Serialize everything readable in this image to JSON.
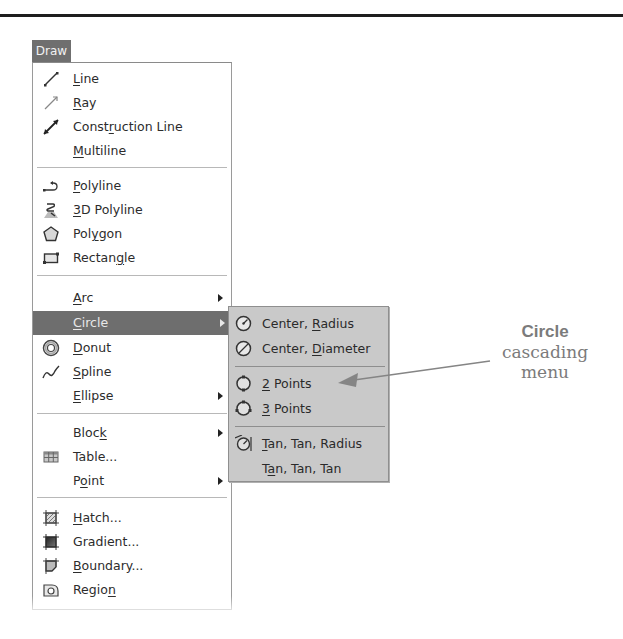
{
  "menu": {
    "title": "Draw",
    "groups": [
      {
        "items": [
          {
            "label_pre": "",
            "mnemonic": "L",
            "label_post": "ine",
            "icon": "line-icon",
            "submenu": false
          },
          {
            "label_pre": "",
            "mnemonic": "R",
            "label_post": "ay",
            "icon": "ray-icon",
            "submenu": false
          },
          {
            "label_pre": "Const",
            "mnemonic": "r",
            "label_post": "uction Line",
            "icon": "construction-line-icon",
            "submenu": false
          },
          {
            "label_pre": "",
            "mnemonic": "M",
            "label_post": "ultiline",
            "icon": "",
            "submenu": false
          }
        ]
      },
      {
        "items": [
          {
            "label_pre": "",
            "mnemonic": "P",
            "label_post": "olyline",
            "icon": "polyline-icon",
            "submenu": false
          },
          {
            "label_pre": "",
            "mnemonic": "3",
            "label_post": "D Polyline",
            "icon": "3d-polyline-icon",
            "submenu": false
          },
          {
            "label_pre": "Pol",
            "mnemonic": "y",
            "label_post": "gon",
            "icon": "polygon-icon",
            "submenu": false
          },
          {
            "label_pre": "Rectan",
            "mnemonic": "g",
            "label_post": "le",
            "icon": "rectangle-icon",
            "submenu": false
          }
        ]
      },
      {
        "items": [
          {
            "label_pre": "",
            "mnemonic": "A",
            "label_post": "rc",
            "icon": "",
            "submenu": true
          },
          {
            "label_pre": "",
            "mnemonic": "C",
            "label_post": "ircle",
            "icon": "",
            "submenu": true,
            "selected": true
          },
          {
            "label_pre": "",
            "mnemonic": "D",
            "label_post": "onut",
            "icon": "donut-icon",
            "submenu": false
          },
          {
            "label_pre": "",
            "mnemonic": "S",
            "label_post": "pline",
            "icon": "spline-icon",
            "submenu": false
          },
          {
            "label_pre": "",
            "mnemonic": "E",
            "label_post": "llipse",
            "icon": "",
            "submenu": true
          }
        ]
      },
      {
        "items": [
          {
            "label_pre": "Bloc",
            "mnemonic": "k",
            "label_post": "",
            "icon": "",
            "submenu": true
          },
          {
            "label_pre": "Table...",
            "mnemonic": "",
            "label_post": "",
            "icon": "table-icon",
            "submenu": false
          },
          {
            "label_pre": "P",
            "mnemonic": "o",
            "label_post": "int",
            "icon": "",
            "submenu": true
          }
        ]
      },
      {
        "items": [
          {
            "label_pre": "",
            "mnemonic": "H",
            "label_post": "atch...",
            "icon": "hatch-icon",
            "submenu": false
          },
          {
            "label_pre": "Gradient...",
            "mnemonic": "",
            "label_post": "",
            "icon": "gradient-icon",
            "submenu": false
          },
          {
            "label_pre": "",
            "mnemonic": "B",
            "label_post": "oundary...",
            "icon": "boundary-icon",
            "submenu": false
          },
          {
            "label_pre": "Regio",
            "mnemonic": "n",
            "label_post": "",
            "icon": "region-icon",
            "submenu": false
          }
        ]
      }
    ]
  },
  "submenu": {
    "parent": "Circle",
    "items": [
      {
        "label_pre": "Center, ",
        "mnemonic": "R",
        "label_post": "adius",
        "icon": "circle-center-radius-icon"
      },
      {
        "label_pre": "Center, ",
        "mnemonic": "D",
        "label_post": "iameter",
        "icon": "circle-center-diameter-icon"
      },
      {
        "label_pre": "",
        "mnemonic": "2",
        "label_post": " Points",
        "icon": "circle-2-points-icon"
      },
      {
        "label_pre": "",
        "mnemonic": "3",
        "label_post": " Points",
        "icon": "circle-3-points-icon"
      },
      {
        "label_pre": "",
        "mnemonic": "T",
        "label_post": "an, Tan, Radius",
        "icon": "circle-tan-tan-radius-icon"
      },
      {
        "label_pre": "T",
        "mnemonic": "a",
        "label_post": "n, Tan, Tan",
        "icon": ""
      }
    ]
  },
  "callout": {
    "line1": "Circle",
    "line2": "cascading",
    "line3": "menu"
  },
  "colors": {
    "menu_title_bg": "#6f6f6f",
    "selected_bg": "#6e6e6e",
    "submenu_bg": "#c9c9c9",
    "callout_text": "#7b7b7b"
  }
}
